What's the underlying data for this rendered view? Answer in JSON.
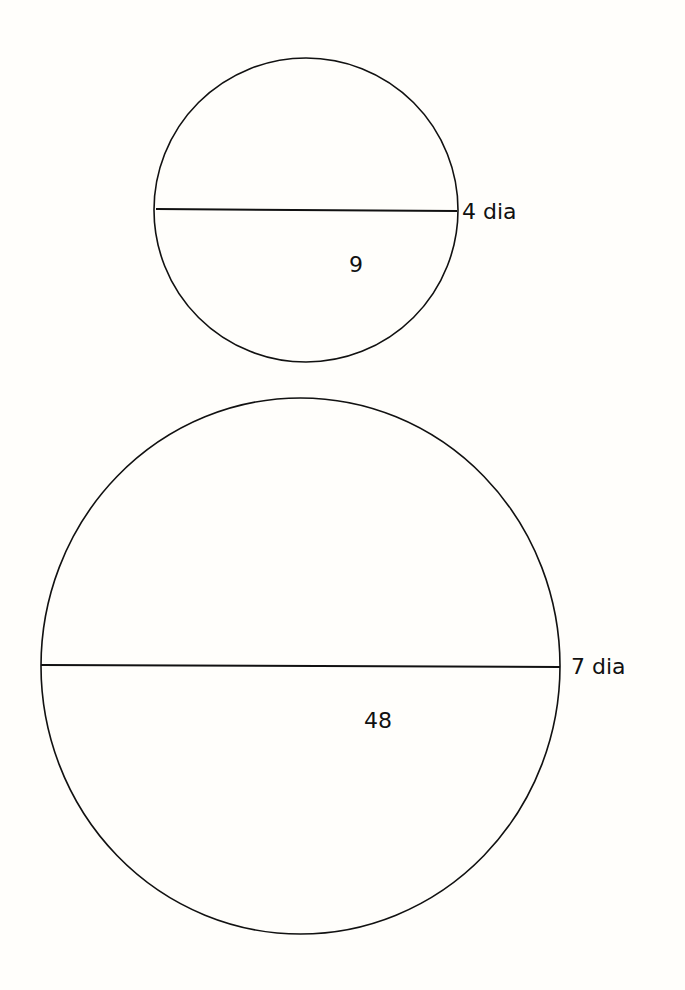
{
  "diagram": {
    "circles": [
      {
        "id": "small",
        "cx": 306,
        "cy": 210,
        "r": 151,
        "diameter_label": "4 dia",
        "area_label": "9"
      },
      {
        "id": "large",
        "cx": 300,
        "cy": 666,
        "r": 260,
        "diameter_label": "7 dia",
        "area_label": "48"
      }
    ],
    "stroke_color": "#111111",
    "background": "#fffefb"
  }
}
